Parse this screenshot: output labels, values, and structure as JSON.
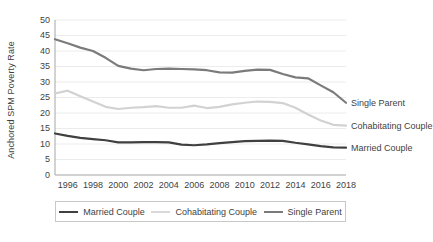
{
  "chart_data": {
    "type": "line",
    "title": "",
    "xlabel": "",
    "ylabel": "Anchored SPM Poverty Rate",
    "ylim": [
      0,
      50
    ],
    "xlim": [
      1995,
      2018
    ],
    "grid": true,
    "legend_position": "bottom",
    "yticks": [
      "0",
      "5",
      "10",
      "15",
      "20",
      "25",
      "30",
      "35",
      "40",
      "45",
      "50"
    ],
    "xticks": [
      "1996",
      "1998",
      "2000",
      "2002",
      "2004",
      "2006",
      "2008",
      "2010",
      "2012",
      "2014",
      "2016",
      "2018"
    ],
    "x": [
      1995,
      1996,
      1997,
      1998,
      1999,
      2000,
      2001,
      2002,
      2003,
      2004,
      2005,
      2006,
      2007,
      2008,
      2009,
      2010,
      2011,
      2012,
      2013,
      2014,
      2015,
      2016,
      2017,
      2018
    ],
    "series": [
      {
        "name": "Married Couple",
        "color": "#404040",
        "width": 2.2,
        "values": [
          13.4,
          12.6,
          12.0,
          11.6,
          11.2,
          10.5,
          10.5,
          10.6,
          10.6,
          10.5,
          9.8,
          9.6,
          9.9,
          10.3,
          10.6,
          10.9,
          11.0,
          11.1,
          11.0,
          10.4,
          9.9,
          9.3,
          8.9,
          8.8
        ]
      },
      {
        "name": "Cohabitating Couple",
        "color": "#d2d2d2",
        "width": 2.2,
        "values": [
          26.3,
          27.2,
          25.4,
          23.7,
          22.0,
          21.3,
          21.7,
          21.9,
          22.2,
          21.7,
          21.7,
          22.4,
          21.6,
          22.0,
          22.8,
          23.3,
          23.7,
          23.6,
          23.2,
          21.7,
          19.5,
          17.6,
          16.2,
          15.9
        ]
      },
      {
        "name": "Single Parent",
        "color": "#7b7b7b",
        "width": 2.2,
        "values": [
          43.8,
          42.5,
          41.1,
          40.0,
          37.8,
          35.2,
          34.3,
          33.8,
          34.2,
          34.3,
          34.2,
          34.1,
          33.8,
          33.1,
          33.0,
          33.6,
          34.0,
          33.9,
          32.6,
          31.5,
          31.2,
          28.9,
          26.7,
          23.3
        ]
      }
    ],
    "series_end_labels": [
      {
        "name": "Single Parent"
      },
      {
        "name": "Cohabitating Couple"
      },
      {
        "name": "Married Couple"
      }
    ],
    "legend": [
      {
        "label": "Married Couple",
        "color": "#404040"
      },
      {
        "label": "Cohabitating Couple",
        "color": "#d9d9d9"
      },
      {
        "label": "Single Parent",
        "color": "#7b7b7b"
      }
    ]
  }
}
